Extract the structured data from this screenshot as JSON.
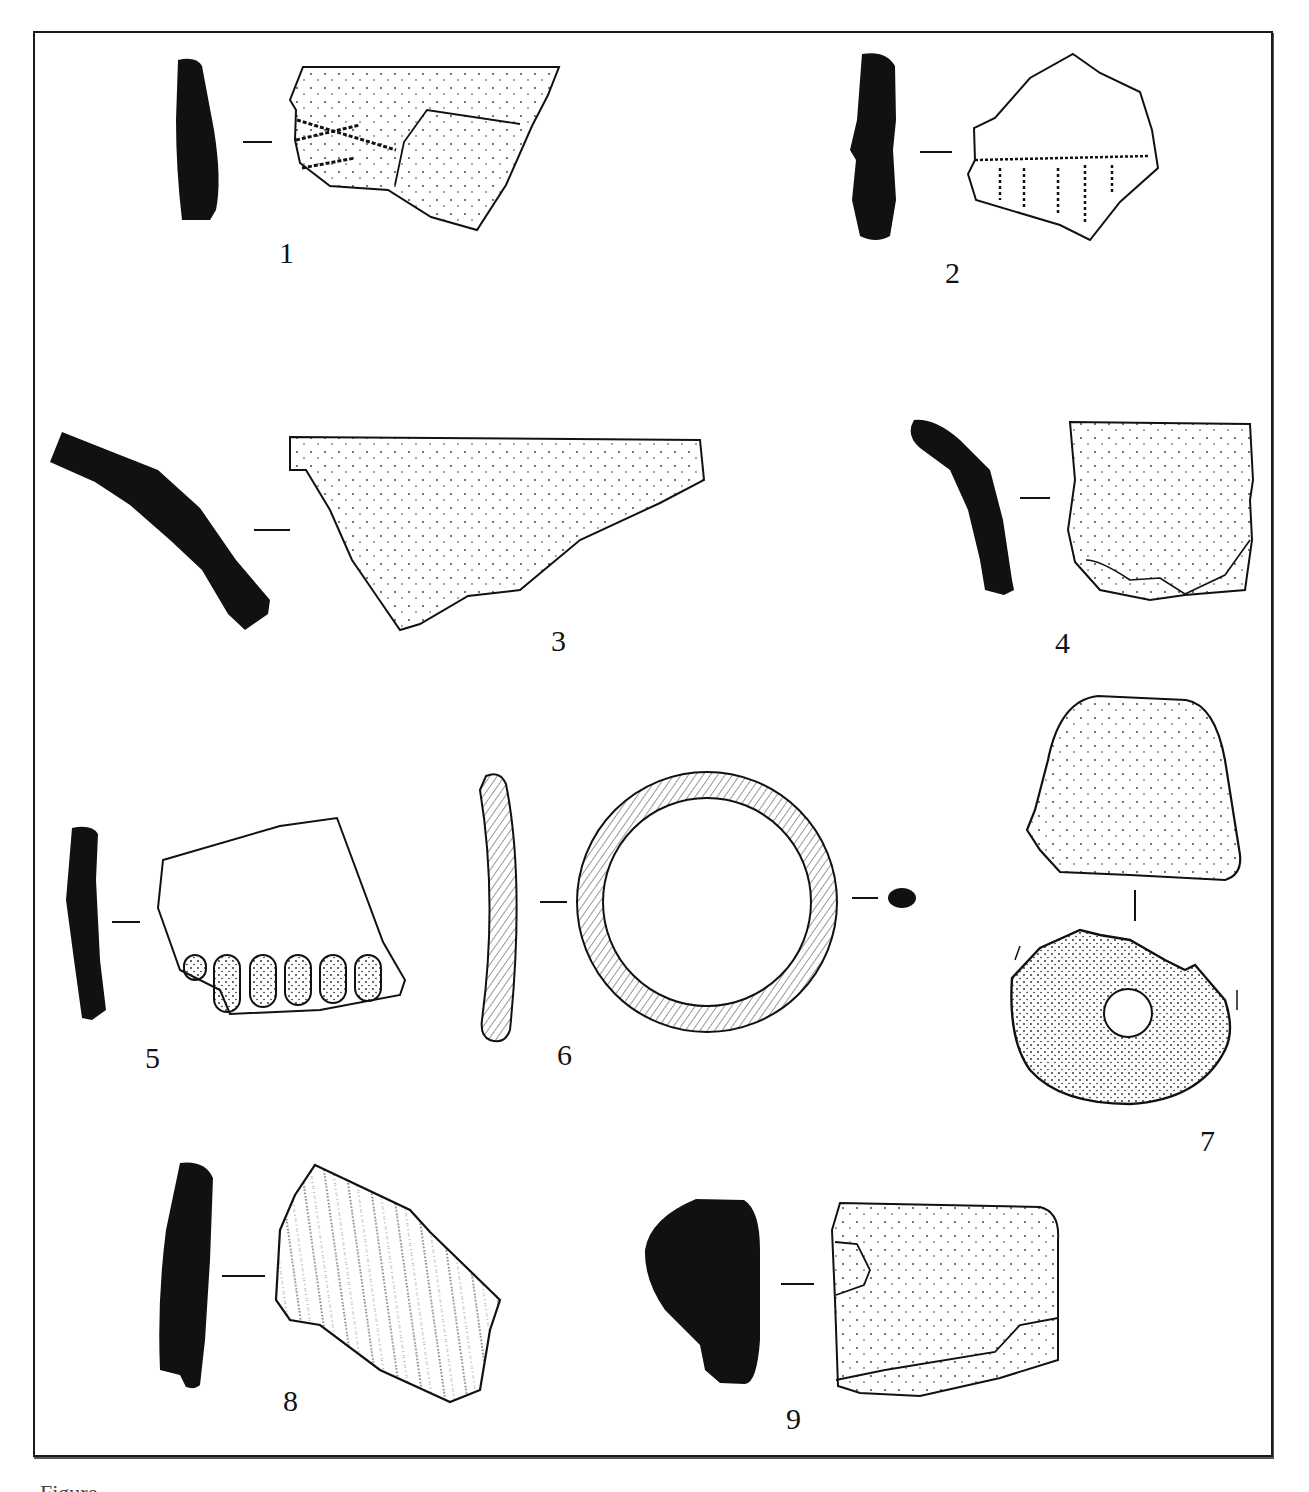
{
  "figure": {
    "type": "archaeological drawing plate",
    "items": [
      {
        "number": "1",
        "label": "1",
        "description": "rim sherd with incised horizontal lines; black profile section"
      },
      {
        "number": "2",
        "label": "2",
        "description": "body sherd with vertical impressed/grooved decoration below a horizontal line; black profile section"
      },
      {
        "number": "3",
        "label": "3",
        "description": "large triangular rim sherd, plain stippled surface; curved black profile"
      },
      {
        "number": "4",
        "label": "4",
        "description": "rim sherd with everted profile; plain surface"
      },
      {
        "number": "5",
        "label": "5",
        "description": "sherd with row of finger-impressed (fluted) decoration at lower edge"
      },
      {
        "number": "6",
        "label": "6",
        "description": "ring / bangle with hatched surface, shown in side view, plan and section"
      },
      {
        "number": "7",
        "label": "7",
        "description": "perforated disc / spindle whorl shown in side view and plan"
      },
      {
        "number": "8",
        "label": "8",
        "description": "body sherd with vertical combed/ribbed decoration"
      },
      {
        "number": "9",
        "label": "9",
        "description": "thick rim sherd with wedge-shaped black profile"
      }
    ]
  },
  "caption": {
    "text": "Figure ...",
    "truncated": true
  },
  "colors": {
    "ink": "#111111",
    "background": "#ffffff"
  }
}
